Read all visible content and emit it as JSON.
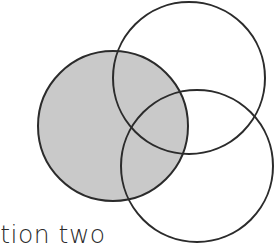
{
  "figure": {
    "title_text": "ction two",
    "background_color": "#ffffff",
    "stroke_color": "#2b2b2b",
    "stroke_width": 2,
    "fill_color": "#c9c9c9",
    "width": 277,
    "height": 250
  },
  "chart_data": {
    "type": "venn",
    "title": "",
    "xlabel": "",
    "ylabel": "",
    "grid": false,
    "legend": "none",
    "units": "pixels",
    "xlim": [
      0,
      277
    ],
    "ylim": [
      0,
      250
    ],
    "sets": [
      {
        "name": "left-circle",
        "label": "",
        "cx": 113,
        "cy": 126,
        "r": 75,
        "filled": true,
        "fill": "#c9c9c9",
        "stroke": "#2b2b2b"
      },
      {
        "name": "top-right-circle",
        "label": "",
        "cx": 189,
        "cy": 78,
        "r": 76,
        "filled": false,
        "fill": "none",
        "stroke": "#2b2b2b"
      },
      {
        "name": "bottom-right-circle",
        "label": "",
        "cx": 197,
        "cy": 166,
        "r": 76,
        "filled": false,
        "fill": "none",
        "stroke": "#2b2b2b"
      }
    ],
    "annotations": [
      {
        "name": "caption",
        "text": "ction two",
        "x": -14,
        "y": 244,
        "clipped": true
      }
    ]
  }
}
